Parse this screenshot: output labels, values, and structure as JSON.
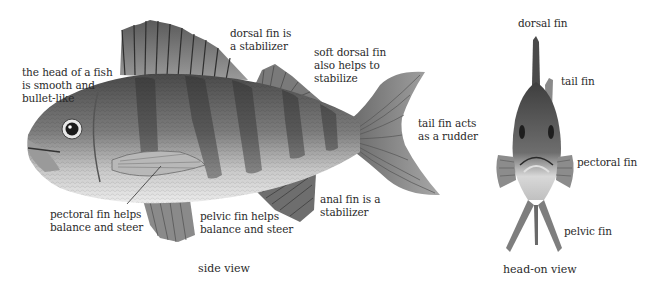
{
  "side_view": {
    "caption": "side view",
    "labels": {
      "head": "the head of a fish\nis smooth and\nbullet-like",
      "dorsal": "dorsal fin is\na stabilizer",
      "soft_dorsal": "soft dorsal fin\nalso helps to\nstabilize",
      "tail": "tail fin acts\nas a rudder",
      "anal": "anal fin is a\nstabilizer",
      "pelvic": "pelvic fin helps\nbalance and steer",
      "pectoral": "pectoral fin helps\nbalance and steer"
    }
  },
  "head_on_view": {
    "caption": "head-on view",
    "labels": {
      "dorsal": "dorsal fin",
      "tail": "tail fin",
      "pectoral": "pectoral fin",
      "pelvic": "pelvic fin"
    }
  },
  "colors": {
    "background": "#ffffff",
    "text": "#2a2a2a",
    "fish_dark": "#3a3a3a",
    "fish_mid": "#8a8a8a",
    "fish_light": "#e6e6e6"
  }
}
